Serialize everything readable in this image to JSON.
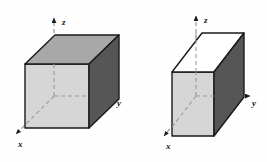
{
  "figure": {
    "title": "",
    "background_color": "#fefefe",
    "width": 267,
    "height": 162,
    "panels": [
      {
        "id": "left-box",
        "name": "wide-rectangular-box",
        "axes": {
          "z": {
            "label": "z",
            "direction": "up",
            "arrow": true,
            "style": "dashed"
          },
          "y": {
            "label": "y",
            "direction": "right",
            "arrow": true,
            "style": "dashed"
          },
          "x": {
            "label": "x",
            "direction": "down-left",
            "arrow": true,
            "style": "dashed"
          }
        },
        "faces": {
          "top": {
            "name": "top-face",
            "color": "#a8a8a8"
          },
          "front": {
            "name": "front-face",
            "color": "#d6d6d6"
          },
          "right": {
            "name": "right-face",
            "color": "#565656"
          }
        },
        "edge_color": "#1a1a1a",
        "shape": "wide box"
      },
      {
        "id": "right-box",
        "name": "tall-rectangular-box",
        "axes": {
          "z": {
            "label": "z",
            "direction": "up",
            "arrow": true,
            "style": "dashed"
          },
          "y": {
            "label": "y",
            "direction": "right",
            "arrow": true,
            "style": "dashed"
          },
          "x": {
            "label": "x",
            "direction": "down-left",
            "arrow": true,
            "style": "dashed"
          }
        },
        "faces": {
          "top": {
            "name": "top-face",
            "color": "#ffffff"
          },
          "front": {
            "name": "front-face",
            "color": "#d6d6d6"
          },
          "right": {
            "name": "right-face",
            "color": "#565656"
          }
        },
        "edge_color": "#1a1a1a",
        "shape": "tall box"
      }
    ],
    "colors": {
      "edge": "#1a1a1a",
      "dashed_axis": "#8c8c8c",
      "face_top_gray": "#a8a8a8",
      "face_top_white": "#ffffff",
      "face_front": "#d6d6d6",
      "face_right": "#565656",
      "label_text": "#1a1a1a"
    }
  }
}
